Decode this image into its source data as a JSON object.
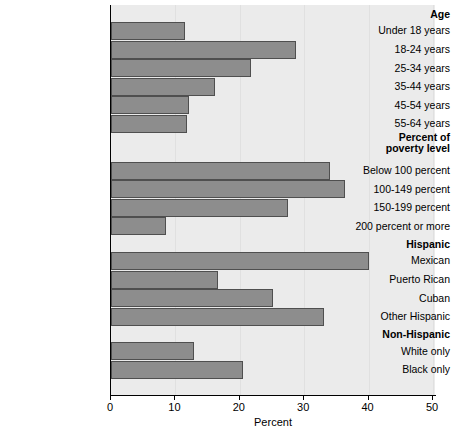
{
  "chart_data": {
    "type": "bar",
    "orientation": "horizontal",
    "title": "",
    "xlabel": "Percent",
    "ylabel": "",
    "xlim": [
      0,
      50
    ],
    "xticks": [
      0,
      10,
      20,
      30,
      40,
      50
    ],
    "xtick_labels": [
      "0",
      "10",
      "20",
      "30",
      "40",
      "50"
    ],
    "grid": false,
    "legend": null,
    "bar_color": "#8d8d8d",
    "bar_edge_color": "#4f4f4f",
    "plot_background": "#ebebeb",
    "rows": [
      {
        "label": "Age",
        "kind": "group",
        "value": null
      },
      {
        "label": "Under 18 years",
        "kind": "bar",
        "value": 11.5
      },
      {
        "label": "18-24 years",
        "kind": "bar",
        "value": 28.7
      },
      {
        "label": "25-34 years",
        "kind": "bar",
        "value": 21.7
      },
      {
        "label": "35-44 years",
        "kind": "bar",
        "value": 16.1
      },
      {
        "label": "45-54 years",
        "kind": "bar",
        "value": 12.1
      },
      {
        "label": "55-64 years",
        "kind": "bar",
        "value": 11.8
      },
      {
        "label": "Percent of poverty level",
        "kind": "group",
        "value": null
      },
      {
        "label": "Below 100 percent",
        "kind": "bar",
        "value": 34.0
      },
      {
        "label": "100-149 percent",
        "kind": "bar",
        "value": 36.3
      },
      {
        "label": "150-199 percent",
        "kind": "bar",
        "value": 27.5
      },
      {
        "label": "200 percent or more",
        "kind": "bar",
        "value": 8.5
      },
      {
        "label": "Hispanic",
        "kind": "group",
        "value": null
      },
      {
        "label": "Mexican",
        "kind": "bar",
        "value": 40.1
      },
      {
        "label": "Puerto Rican",
        "kind": "bar",
        "value": 16.6
      },
      {
        "label": "Cuban",
        "kind": "bar",
        "value": 25.2
      },
      {
        "label": "Other Hispanic",
        "kind": "bar",
        "value": 33.1
      },
      {
        "label": "Non-Hispanic",
        "kind": "group",
        "value": null
      },
      {
        "label": "White only",
        "kind": "bar",
        "value": 12.9
      },
      {
        "label": "Black only",
        "kind": "bar",
        "value": 20.5
      }
    ]
  }
}
